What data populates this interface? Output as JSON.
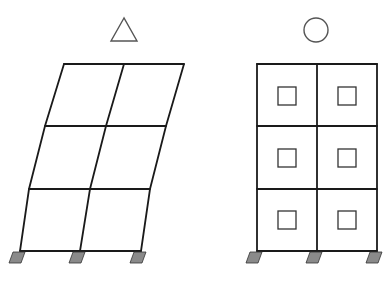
{
  "diagram": {
    "description": "Comparison of two 2-bay, 3-story frames: deformed frame without infill vs. braced frame with infill panels",
    "colors": {
      "line": "#1a1a1a",
      "symbol": "#555555",
      "support": "#8a8a8a",
      "infill": "#333333"
    },
    "left_frame": {
      "label": "frame without infill (sways)",
      "symbol": "triangle",
      "levels": [
        {
          "y": 64,
          "x_left": 64,
          "x_mid": 124,
          "x_right": 184
        },
        {
          "y": 126,
          "x_left": 45,
          "x_mid": 106,
          "x_right": 166
        },
        {
          "y": 189,
          "x_left": 29,
          "x_mid": 90,
          "x_right": 150
        },
        {
          "y": 251,
          "x_left": 20,
          "x_mid": 80,
          "x_right": 141
        }
      ],
      "supports_x": [
        20,
        80,
        141
      ]
    },
    "right_frame": {
      "label": "frame with infill panels (rigid)",
      "symbol": "circle",
      "columns_x": [
        257,
        317,
        377
      ],
      "beams_y": [
        64,
        126,
        189,
        251
      ],
      "panels": [
        {
          "x": 278,
          "y": 87
        },
        {
          "x": 338,
          "y": 87
        },
        {
          "x": 278,
          "y": 149
        },
        {
          "x": 338,
          "y": 149
        },
        {
          "x": 278,
          "y": 211
        },
        {
          "x": 338,
          "y": 211
        }
      ],
      "panel_size": 18,
      "supports_x": [
        257,
        317,
        377
      ]
    },
    "symbols": {
      "triangle": {
        "apex": [
          124,
          18
        ],
        "base_left": [
          111,
          41
        ],
        "base_right": [
          137,
          41
        ]
      },
      "circle": {
        "cx": 316,
        "cy": 30,
        "r": 12
      }
    }
  }
}
